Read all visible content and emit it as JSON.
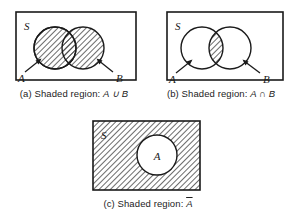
{
  "figure": {
    "panels": [
      {
        "id": "a",
        "universe_label": "S",
        "set_labels": [
          "A",
          "B"
        ],
        "caption_prefix": "(a) Shaded region: ",
        "caption_expr": "A ∪ B",
        "caption_full": "(a) Shaded region: A ∪ B",
        "shaded": "both circles (union)",
        "shape": "two-overlapping-circles"
      },
      {
        "id": "b",
        "universe_label": "S",
        "set_labels": [
          "A",
          "B"
        ],
        "caption_prefix": "(b) Shaded region: ",
        "caption_expr": "A ∩ B",
        "caption_full": "(b) Shaded region: A ∩ B",
        "shaded": "lens overlap only (intersection)",
        "shape": "two-overlapping-circles"
      },
      {
        "id": "c",
        "universe_label": "S",
        "set_labels": [
          "A"
        ],
        "caption_prefix": "(c) Shaded region: ",
        "caption_expr": "A",
        "caption_overline": true,
        "caption_full": "(c) Shaded region: A̅",
        "shaded": "rectangle outside circle (complement)",
        "shape": "single-circle-in-rectangle"
      }
    ],
    "colors": {
      "stroke": "#1a1a1a",
      "hatch": "#3a3a3a",
      "fill": "#ffffff",
      "background": "#ffffff"
    }
  }
}
